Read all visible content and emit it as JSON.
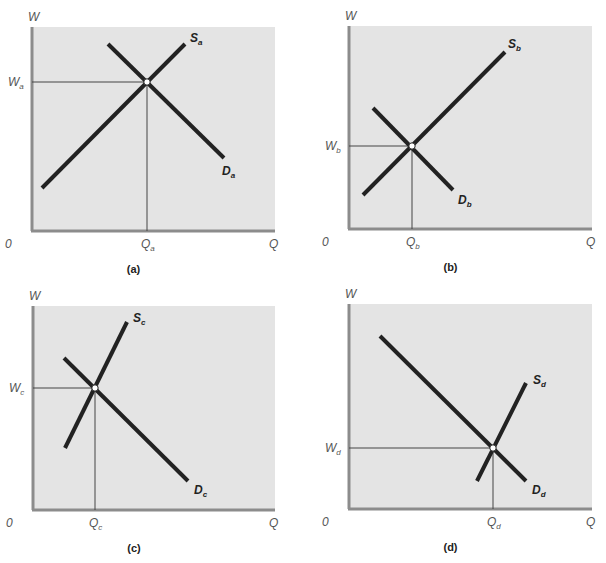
{
  "colors": {
    "background": "#ffffff",
    "plot_fill": "#e4e4e4",
    "axis": "#8c8c8c",
    "curve": "#222222",
    "guide": "#444444",
    "label": "#555555"
  },
  "chart_data": [
    {
      "type": "line",
      "panel": "(a)",
      "title": "",
      "xlabel": "Q",
      "ylabel": "W",
      "origin_label": "0",
      "box": {
        "x0": 32,
        "y0": 27,
        "x1": 275,
        "y1": 231
      },
      "series": [
        {
          "name": "S_a",
          "label_main": "S",
          "label_sub": "a",
          "points": [
            [
              42,
              188
            ],
            [
              185,
              44
            ]
          ],
          "label_pos": [
            190,
            42
          ]
        },
        {
          "name": "D_a",
          "label_main": "D",
          "label_sub": "a",
          "points": [
            [
              108,
              44
            ],
            [
              224,
              158
            ]
          ],
          "label_pos": [
            222,
            175
          ]
        }
      ],
      "equilibrium": {
        "x": 147,
        "y": 82,
        "w_label_main": "W",
        "w_label_sub": "a",
        "q_label_main": "Q",
        "q_label_sub": "a"
      },
      "caption": "(a)",
      "note": "Supply and demand of similar slope; equilibrium high wage, mid quantity"
    },
    {
      "type": "line",
      "panel": "(b)",
      "title": "",
      "xlabel": "Q",
      "ylabel": "W",
      "origin_label": "0",
      "box": {
        "x0": 349,
        "y0": 26,
        "x1": 592,
        "y1": 229
      },
      "series": [
        {
          "name": "S_b",
          "label_main": "S",
          "label_sub": "b",
          "points": [
            [
              363,
              195
            ],
            [
              505,
              52
            ]
          ],
          "label_pos": [
            508,
            48
          ]
        },
        {
          "name": "D_b",
          "label_main": "D",
          "label_sub": "b",
          "points": [
            [
              373,
              108
            ],
            [
              453,
              190
            ]
          ],
          "label_pos": [
            458,
            204
          ]
        }
      ],
      "equilibrium": {
        "x": 412,
        "y": 146,
        "w_label_main": "W",
        "w_label_sub": "b",
        "q_label_main": "Q",
        "q_label_sub": "b"
      },
      "caption": "(b)",
      "note": "Low equilibrium wage and low quantity"
    },
    {
      "type": "line",
      "panel": "(c)",
      "title": "",
      "xlabel": "Q",
      "ylabel": "W",
      "origin_label": "0",
      "box": {
        "x0": 33,
        "y0": 306,
        "x1": 275,
        "y1": 510
      },
      "series": [
        {
          "name": "S_c",
          "label_main": "S",
          "label_sub": "c",
          "points": [
            [
              65,
              448
            ],
            [
              127,
              322
            ]
          ],
          "label_pos": [
            133,
            322
          ]
        },
        {
          "name": "D_c",
          "label_main": "D",
          "label_sub": "c",
          "points": [
            [
              64,
              358
            ],
            [
              188,
              481
            ]
          ],
          "label_pos": [
            194,
            494
          ]
        }
      ],
      "equilibrium": {
        "x": 95,
        "y": 388,
        "w_label_main": "W",
        "w_label_sub": "c",
        "q_label_main": "Q",
        "q_label_sub": "c"
      },
      "caption": "(c)",
      "note": "Steep supply; equilibrium at low quantity, moderate wage"
    },
    {
      "type": "line",
      "panel": "(d)",
      "title": "",
      "xlabel": "Q",
      "ylabel": "W",
      "origin_label": "0",
      "box": {
        "x0": 349,
        "y0": 304,
        "x1": 592,
        "y1": 509
      },
      "series": [
        {
          "name": "S_d",
          "label_main": "S",
          "label_sub": "d",
          "points": [
            [
              477,
              481
            ],
            [
              526,
              383
            ]
          ],
          "label_pos": [
            533,
            384
          ]
        },
        {
          "name": "D_d",
          "label_main": "D",
          "label_sub": "d",
          "points": [
            [
              380,
              336
            ],
            [
              526,
              481
            ]
          ],
          "label_pos": [
            532,
            494
          ]
        }
      ],
      "equilibrium": {
        "x": 493,
        "y": 448,
        "w_label_main": "W",
        "w_label_sub": "d",
        "q_label_main": "Q",
        "q_label_sub": "d"
      },
      "caption": "(d)",
      "note": "Equilibrium at high quantity, low wage"
    }
  ]
}
